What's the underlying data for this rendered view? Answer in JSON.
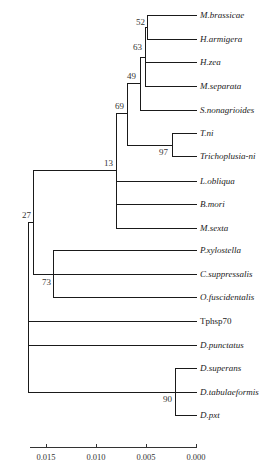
{
  "figure": {
    "type": "phylogenetic-tree",
    "leaves": [
      {
        "name": "M.brassicae",
        "italic": true
      },
      {
        "name": "H.armigera",
        "italic": true
      },
      {
        "name": "H.zea",
        "italic": true
      },
      {
        "name": "M.separata",
        "italic": true
      },
      {
        "name": "S.nonagrioides",
        "italic": true
      },
      {
        "name": "T.ni",
        "italic": true
      },
      {
        "name": "Trichoplusia-ni",
        "italic": true
      },
      {
        "name": "L.obliqua",
        "italic": true
      },
      {
        "name": "B.mori",
        "italic": true
      },
      {
        "name": "M.sexta",
        "italic": true
      },
      {
        "name": "P.xylostella",
        "italic": true
      },
      {
        "name": "C.suppressalis",
        "italic": true
      },
      {
        "name": "O.fuscidentalis",
        "italic": true
      },
      {
        "name": "Tphsp70",
        "italic": false
      },
      {
        "name": "D.punctatus",
        "italic": true
      },
      {
        "name": "D.superans",
        "italic": true
      },
      {
        "name": "D.tabulaeformis",
        "italic": true
      },
      {
        "name": "D.pxt",
        "italic": true
      }
    ],
    "support_values": {
      "n52": "52",
      "n63": "63",
      "n49": "49",
      "n69": "69",
      "n97": "97",
      "n13": "13",
      "n27": "27",
      "n73": "73",
      "n90": "90"
    },
    "scale_axis": {
      "ticks": [
        "0.015",
        "0.010",
        "0.005",
        "0.000"
      ]
    }
  }
}
